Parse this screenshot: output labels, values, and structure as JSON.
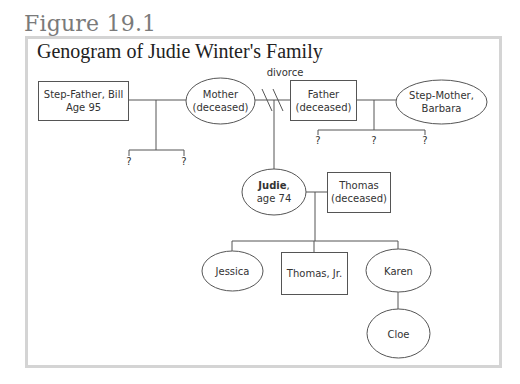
{
  "figure": {
    "label": "Figure 19.1",
    "title": "Genogram of Judie Winter's Family"
  },
  "colors": {
    "frame_border": "#d4d4d4",
    "figure_label": "#7a7a7a",
    "line": "#555555",
    "text": "#333333"
  },
  "annotations": {
    "divorce": "divorce",
    "unknown_child": "?"
  },
  "people": {
    "step_father": {
      "line1": "Step-Father, Bill",
      "line2": "Age 95",
      "shape": "square",
      "sex": "male"
    },
    "mother": {
      "line1": "Mother",
      "line2": "(deceased)",
      "shape": "circle",
      "sex": "female"
    },
    "father": {
      "line1": "Father",
      "line2": "(deceased)",
      "shape": "square",
      "sex": "male"
    },
    "step_mother": {
      "line1": "Step-Mother,",
      "line2": "Barbara",
      "shape": "circle",
      "sex": "female"
    },
    "judie": {
      "name": "Judie",
      "suffix": ",",
      "line2": "age 74",
      "shape": "circle",
      "sex": "female",
      "index_person": true
    },
    "thomas": {
      "line1": "Thomas",
      "line2": "(deceased)",
      "shape": "square",
      "sex": "male"
    },
    "jessica": {
      "line1": "Jessica",
      "shape": "circle",
      "sex": "female"
    },
    "thomas_jr": {
      "line1": "Thomas, Jr.",
      "shape": "square",
      "sex": "male"
    },
    "karen": {
      "line1": "Karen",
      "shape": "circle",
      "sex": "female"
    },
    "cloe": {
      "line1": "Cloe",
      "shape": "circle",
      "sex": "female"
    }
  },
  "relationships": [
    {
      "type": "marriage",
      "between": [
        "step_father",
        "mother"
      ],
      "children": [
        "?",
        "?"
      ]
    },
    {
      "type": "divorce",
      "between": [
        "mother",
        "father"
      ],
      "children": [
        "judie"
      ]
    },
    {
      "type": "marriage",
      "between": [
        "father",
        "step_mother"
      ],
      "children": [
        "?",
        "?",
        "?"
      ]
    },
    {
      "type": "marriage",
      "between": [
        "judie",
        "thomas"
      ],
      "children": [
        "jessica",
        "thomas_jr",
        "karen"
      ]
    },
    {
      "type": "parent-child",
      "between": [
        "karen",
        "cloe"
      ]
    }
  ]
}
